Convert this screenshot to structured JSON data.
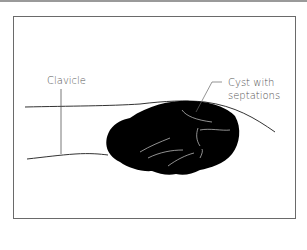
{
  "figure": {
    "labels": {
      "clavicle": "Clavicle",
      "cyst_line1": "Cyst with",
      "cyst_line2": "septations"
    },
    "colors": {
      "frame": "#6a6a6a",
      "cyst_fill": "#000000",
      "lines": "#444444",
      "septations": "#cfcfcf",
      "top_bar": "#9a9a9a"
    }
  }
}
